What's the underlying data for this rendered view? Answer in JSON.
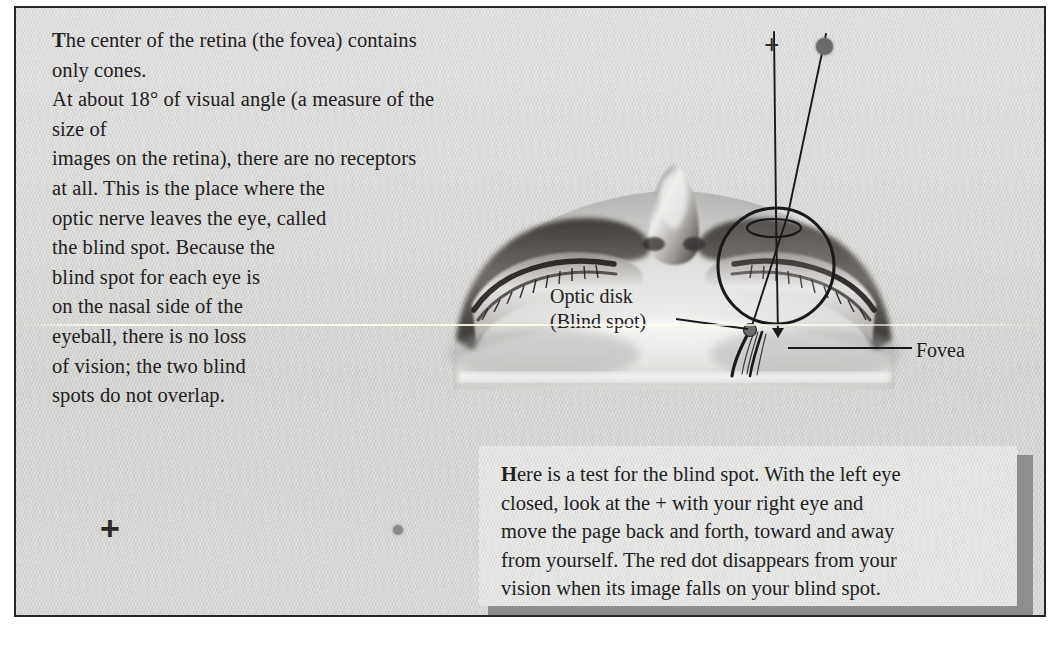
{
  "figure": {
    "domain": "textbook-illustration",
    "topic": "Blind spot and fovea of the retina"
  },
  "body": {
    "dropcap": "T",
    "text": "he center of the retina (the fovea) contains only cones.\nAt about 18° of visual angle (a measure of the size of\nimages on the retina), there are no receptors\nat all. This is the place where the\noptic nerve leaves the eye, called\nthe blind spot. Because the\nblind spot for each eye is\non the nasal side of the\neyeball, there is no loss\nof vision; the two blind\nspots do not overlap."
  },
  "labels": {
    "optic_disk_line1": "Optic disk",
    "optic_disk_line2": "(Blind spot)",
    "fovea": "Fovea"
  },
  "markers": {
    "top_plus": "+",
    "top_dot": "●",
    "test_plus": "+",
    "test_dot": "●"
  },
  "caption": {
    "dropcap": "H",
    "text": "ere is a test for the blind spot. With the left eye\nclosed, look at the + with your right eye and\nmove the page back and forth, toward and away\nfrom yourself. The red dot disappears from your\nvision when its image falls on your blind spot."
  },
  "colors": {
    "paper": "#d6d6d4",
    "ink": "#222020",
    "border": "#262626",
    "caption_panel": "#e3e3e1",
    "caption_shadow": "#8e8e8c",
    "marker_dot": "#6b6b6b",
    "test_dot": "#8a8a8a"
  }
}
